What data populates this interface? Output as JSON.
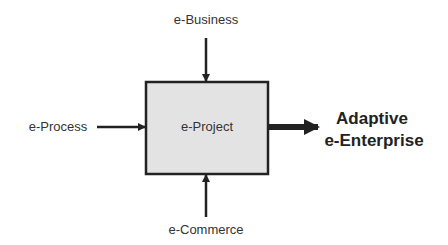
{
  "diagram": {
    "center": {
      "label": "e-Project",
      "fill": "#e3e3e3",
      "stroke": "#222222"
    },
    "inputs": {
      "top": "e-Business",
      "left": "e-Process",
      "bottom": "e-Commerce"
    },
    "output": {
      "line1": "Adaptive",
      "line2": "e-Enterprise"
    }
  }
}
